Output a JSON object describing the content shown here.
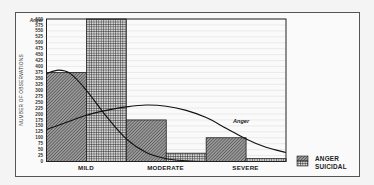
{
  "chart_data": {
    "type": "bar",
    "title": "",
    "xlabel": "",
    "ylabel": "NUMBER OF OBSERVATIONS",
    "ylim": [
      0,
      600
    ],
    "yticks": [
      0,
      25,
      50,
      75,
      100,
      125,
      150,
      175,
      200,
      225,
      250,
      275,
      300,
      325,
      350,
      375,
      400,
      425,
      450,
      475,
      500,
      525,
      550,
      575,
      600
    ],
    "ytop_label": "Anger",
    "categories": [
      "MILD",
      "MODERATE",
      "SEVERE"
    ],
    "series": [
      {
        "name": "ANGER",
        "values": [
          375,
          175,
          100
        ],
        "pattern": "diagonal-hatch"
      },
      {
        "name": "SUICIDAL",
        "values": [
          600,
          35,
          12
        ],
        "pattern": "cross-hatch",
        "note": "MILD bar clipped at axis top"
      }
    ],
    "curves": [
      {
        "name": "Suicidal fit",
        "label": "",
        "points": [
          [
            0,
            370
          ],
          [
            0.15,
            385
          ],
          [
            0.3,
            370
          ],
          [
            0.5,
            300
          ],
          [
            0.75,
            190
          ],
          [
            1.0,
            95
          ],
          [
            1.25,
            38
          ],
          [
            1.5,
            12
          ],
          [
            1.75,
            3
          ],
          [
            2.0,
            0
          ],
          [
            2.5,
            0
          ],
          [
            3.0,
            0
          ]
        ]
      },
      {
        "name": "Anger fit",
        "label": "Anger",
        "points": [
          [
            0,
            135
          ],
          [
            0.25,
            165
          ],
          [
            0.5,
            195
          ],
          [
            0.75,
            215
          ],
          [
            1.0,
            230
          ],
          [
            1.25,
            238
          ],
          [
            1.5,
            233
          ],
          [
            1.75,
            215
          ],
          [
            2.0,
            185
          ],
          [
            2.25,
            140
          ],
          [
            2.5,
            95
          ],
          [
            2.75,
            60
          ],
          [
            3.0,
            38
          ]
        ]
      }
    ],
    "grid": "dotted horizontal",
    "legend": {
      "position": "bottom-right",
      "entries": [
        "ANGER",
        "SUICIDAL"
      ]
    }
  },
  "axis": {
    "ylabel": "NUMBER OF OBSERVATIONS",
    "top_label": "Anger"
  },
  "legend": {
    "anger": "ANGER",
    "suicidal": "SUICIDAL"
  },
  "categories": {
    "c0": "MILD",
    "c1": "MODERATE",
    "c2": "SEVERE"
  },
  "curve_label": "Anger"
}
